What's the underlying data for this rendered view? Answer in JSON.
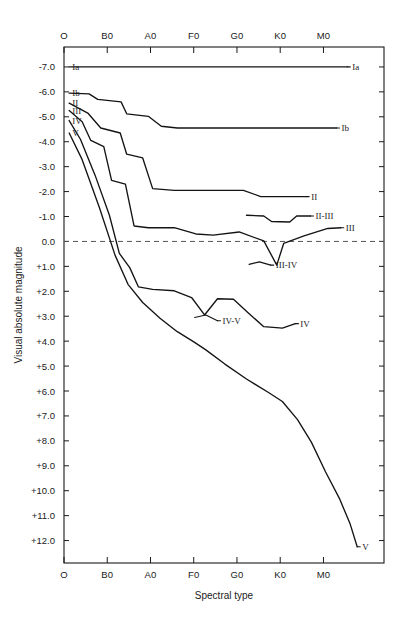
{
  "chart_data": {
    "type": "line",
    "title": "",
    "xlabel": "Spectral type",
    "ylabel": "Visual absolute magnitude",
    "grid": false,
    "legend_position": "inline-right",
    "x_tick_labels": [
      "O",
      "B0",
      "A0",
      "F0",
      "G0",
      "K0",
      "M0"
    ],
    "x_tick_positions": [
      0,
      1,
      2,
      3,
      4,
      5,
      6
    ],
    "xlim": [
      0,
      7.4
    ],
    "y_tick_labels": [
      "-7.0",
      "-6.0",
      "-5.0",
      "-4.0",
      "-3.0",
      "-2.0",
      "-1.0",
      "0.0",
      "+1.0",
      "+2.0",
      "+3.0",
      "+4.0",
      "+5.0",
      "+6.0",
      "+7.0",
      "+8.0",
      "+9.0",
      "+10.0",
      "+11.0",
      "+12.0"
    ],
    "y_tick_values": [
      -7,
      -6,
      -5,
      -4,
      -3,
      -2,
      -1,
      0,
      1,
      2,
      3,
      4,
      5,
      6,
      7,
      8,
      9,
      10,
      11,
      12
    ],
    "ylim": [
      -7.8,
      12.9
    ],
    "y_axis_inverted": true,
    "reference_line": {
      "value": 0.0,
      "style": "dashed"
    },
    "series": [
      {
        "name": "Ia",
        "label_left": "Ia",
        "label_right": "Ia",
        "points": [
          [
            0.12,
            -7.0
          ],
          [
            6.55,
            -7.0
          ]
        ]
      },
      {
        "name": "Ib",
        "label_left": "Ib",
        "label_right": "Ib",
        "points": [
          [
            0.12,
            -5.95
          ],
          [
            0.58,
            -5.92
          ],
          [
            0.78,
            -5.7
          ],
          [
            1.32,
            -5.6
          ],
          [
            1.45,
            -5.12
          ],
          [
            1.95,
            -5.02
          ],
          [
            2.25,
            -4.62
          ],
          [
            2.62,
            -4.55
          ],
          [
            6.3,
            -4.55
          ]
        ]
      },
      {
        "name": "II",
        "label_left": "II",
        "label_right": "II",
        "points": [
          [
            0.12,
            -5.55
          ],
          [
            0.55,
            -5.15
          ],
          [
            0.85,
            -4.55
          ],
          [
            1.3,
            -4.35
          ],
          [
            1.45,
            -3.5
          ],
          [
            1.82,
            -3.35
          ],
          [
            2.05,
            -2.12
          ],
          [
            2.55,
            -2.05
          ],
          [
            4.15,
            -2.05
          ],
          [
            4.55,
            -1.8
          ],
          [
            5.6,
            -1.8
          ]
        ]
      },
      {
        "name": "II-III",
        "label_right": "II-III",
        "points": [
          [
            4.22,
            -1.05
          ],
          [
            4.62,
            -1.02
          ],
          [
            4.8,
            -0.8
          ],
          [
            5.22,
            -0.78
          ],
          [
            5.38,
            -1.02
          ],
          [
            5.7,
            -1.02
          ]
        ]
      },
      {
        "name": "III",
        "label_left": "III",
        "label_right": "III",
        "points": [
          [
            0.12,
            -5.25
          ],
          [
            0.42,
            -4.8
          ],
          [
            0.62,
            -4.05
          ],
          [
            0.92,
            -3.8
          ],
          [
            1.1,
            -2.45
          ],
          [
            1.42,
            -2.3
          ],
          [
            1.62,
            -0.62
          ],
          [
            1.95,
            -0.55
          ],
          [
            2.55,
            -0.55
          ],
          [
            3.05,
            -0.3
          ],
          [
            3.45,
            -0.25
          ],
          [
            4.05,
            -0.38
          ],
          [
            4.62,
            -0.02
          ],
          [
            4.92,
            0.95
          ],
          [
            5.08,
            0.08
          ],
          [
            5.55,
            -0.22
          ],
          [
            6.1,
            -0.52
          ],
          [
            6.4,
            -0.55
          ]
        ]
      },
      {
        "name": "III-IV",
        "label_right": "III-IV",
        "points": [
          [
            4.28,
            0.92
          ],
          [
            4.52,
            0.82
          ],
          [
            4.78,
            0.95
          ]
        ]
      },
      {
        "name": "IV",
        "label_left": "IV",
        "label_right": "IV",
        "points": [
          [
            0.12,
            -4.85
          ],
          [
            0.38,
            -4.1
          ],
          [
            0.72,
            -2.65
          ],
          [
            1.05,
            -1.05
          ],
          [
            1.28,
            0.48
          ],
          [
            1.52,
            1.05
          ],
          [
            1.72,
            1.82
          ],
          [
            2.05,
            1.92
          ],
          [
            2.55,
            1.98
          ],
          [
            2.95,
            2.25
          ],
          [
            3.25,
            2.95
          ],
          [
            3.55,
            2.3
          ],
          [
            3.92,
            2.32
          ],
          [
            4.25,
            2.85
          ],
          [
            4.62,
            3.42
          ],
          [
            5.05,
            3.48
          ],
          [
            5.35,
            3.3
          ]
        ]
      },
      {
        "name": "IV-V",
        "label_right": "IV-V",
        "points": [
          [
            3.02,
            3.05
          ],
          [
            3.28,
            2.95
          ],
          [
            3.55,
            3.18
          ]
        ]
      },
      {
        "name": "V",
        "label_left": "V",
        "label_right": "V",
        "points": [
          [
            0.12,
            -4.35
          ],
          [
            0.42,
            -3.28
          ],
          [
            0.82,
            -1.35
          ],
          [
            1.18,
            0.55
          ],
          [
            1.48,
            1.72
          ],
          [
            1.82,
            2.45
          ],
          [
            2.22,
            3.08
          ],
          [
            2.62,
            3.62
          ],
          [
            3.02,
            4.05
          ],
          [
            3.28,
            4.35
          ],
          [
            3.72,
            4.92
          ],
          [
            4.22,
            5.52
          ],
          [
            4.72,
            6.05
          ],
          [
            5.05,
            6.42
          ],
          [
            5.4,
            7.15
          ],
          [
            5.72,
            8.05
          ],
          [
            6.05,
            9.25
          ],
          [
            6.38,
            10.35
          ],
          [
            6.62,
            11.35
          ],
          [
            6.78,
            12.25
          ]
        ]
      }
    ]
  },
  "axes": {
    "x_label": "Spectral type",
    "y_label": "Visual absolute magnitude",
    "top_ticks": [
      "O",
      "B0",
      "A0",
      "F0",
      "G0",
      "K0",
      "M0"
    ],
    "bottom_ticks": [
      "O",
      "B0",
      "A0",
      "F0",
      "G0",
      "K0",
      "M0"
    ],
    "y_ticks": [
      "-7.0",
      "-6.0",
      "-5.0",
      "-4.0",
      "-3.0",
      "-2.0",
      "-1.0",
      "0.0",
      "+1.0",
      "+2.0",
      "+3.0",
      "+4.0",
      "+5.0",
      "+6.0",
      "+7.0",
      "+8.0",
      "+9.0",
      "+10.0",
      "+11.0",
      "+12.0"
    ]
  },
  "series_labels": {
    "Ia_left": "Ia",
    "Ia_right": "Ia",
    "Ib_left": "Ib",
    "Ib_right": "Ib",
    "II_left": "II",
    "II_right": "II",
    "III_left": "III",
    "III_right": "III",
    "IV_left": "IV",
    "IV_right": "IV",
    "V_left": "V",
    "V_right": "V",
    "II_III": "II-III",
    "III_IV": "III-IV",
    "IV_V": "IV-V"
  },
  "colors": {
    "ink": "#1a1a1a",
    "curve": "#141414",
    "dashed": "#555555",
    "background": "#ffffff"
  }
}
